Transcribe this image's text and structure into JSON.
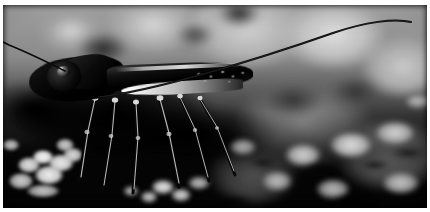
{
  "image": {
    "title": "Cricket on rocky ground",
    "subject": "cricket",
    "orientation": "landscape",
    "width_px": 430,
    "height_px": 212,
    "color_mode": "grayscale",
    "style": "macro nature photograph, shallow depth of field",
    "border": {
      "present": true,
      "color": "#ffffff",
      "thickness_px": 3
    },
    "palette": {
      "deep_black": "#050505",
      "body_dark": "#0d0d0d",
      "mid_gray": "#8a8a8a",
      "background_gray": "#b0b0b0",
      "highlight_white": "#f2f2f2",
      "rock_light": "#e6e6e6"
    },
    "regions": {
      "background": "blurred pale gray rocks and bokeh across the upper half",
      "foreground": "dark shadowed ground with bright pebble clusters along the bottom",
      "subject_position": "left of centre, facing left, in profile"
    },
    "subject_parts": [
      {
        "name": "head",
        "description": "dark rounded head at far left of the body"
      },
      {
        "name": "eye",
        "description": "small glossy compound eye with a bright specular glint"
      },
      {
        "name": "pronotum",
        "description": "shield-like segment behind the head"
      },
      {
        "name": "thorax",
        "description": "bulky dark thorax mass"
      },
      {
        "name": "wing",
        "description": "long dark tegmen with a pale edge running along the back"
      },
      {
        "name": "ovipositor",
        "description": "bright pale blade extending to the right, the brightest element in the frame"
      },
      {
        "name": "antenna-right",
        "description": "very long thin antenna arcing up and to the right, nearly reaching the frame edge"
      },
      {
        "name": "antenna-left",
        "description": "second antenna sweeping up toward the upper-left corner"
      },
      {
        "name": "legs",
        "description": "six thin legs descending into shadow, each catching a thread of highlight"
      }
    ]
  }
}
